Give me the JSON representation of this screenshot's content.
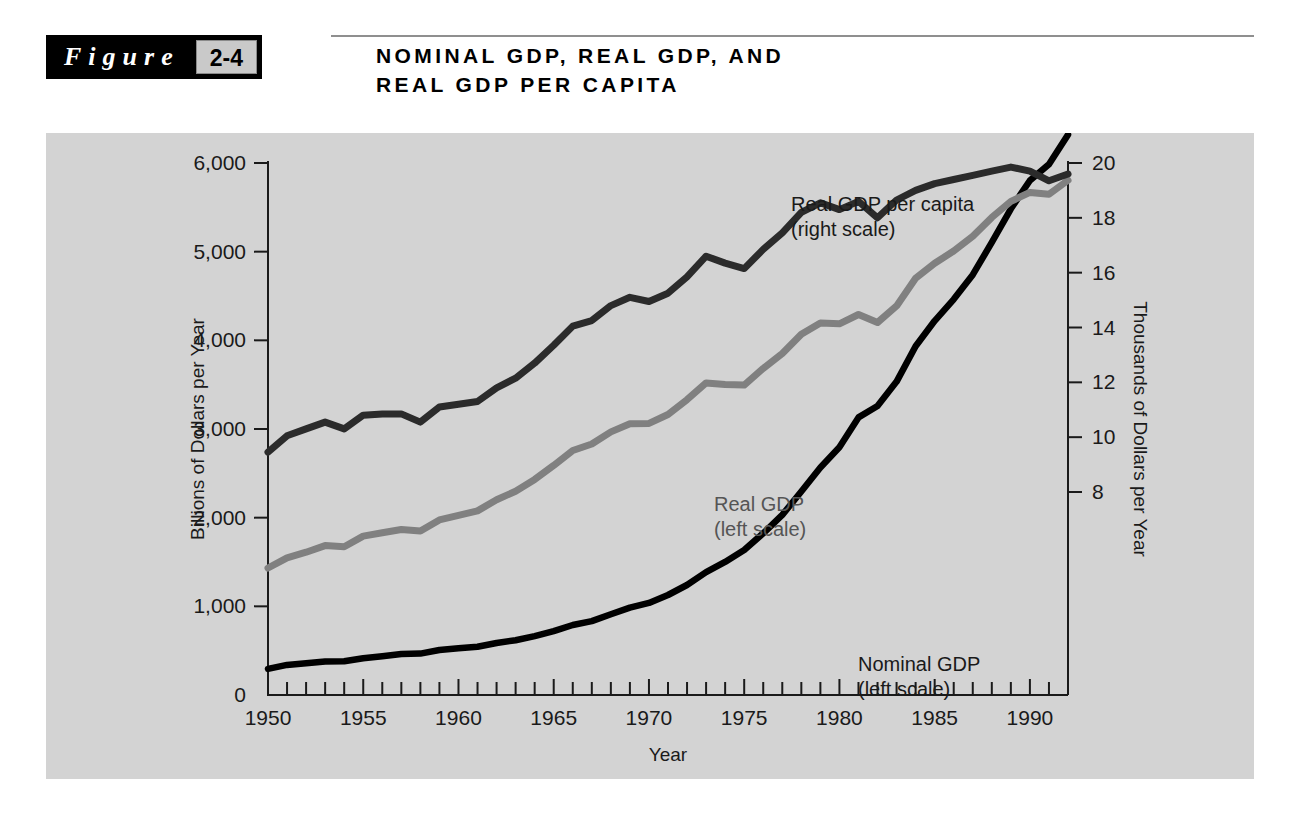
{
  "figure": {
    "word": "Figure",
    "number": "2-4",
    "title": "NOMINAL GDP, REAL GDP, AND\nREAL GDP PER CAPITA"
  },
  "colors": {
    "panel_background": "#d3d3d3",
    "nominal_gdp": "#000000",
    "real_gdp": "#808080",
    "real_gdp_per_capita": "#2b2b2b",
    "tag_background": "#000000",
    "number_box_background": "#c9c9c9"
  },
  "chart_data": {
    "type": "line",
    "title": "NOMINAL GDP, REAL GDP, AND REAL GDP PER CAPITA",
    "xlabel": "Year",
    "ylabel": "Billions of Dollars per Year",
    "y2label": "Thousands of Dollars per Year",
    "xlim": [
      1950,
      1992
    ],
    "ylim": [
      0,
      6000
    ],
    "y2lim": [
      6,
      20.8
    ],
    "grid": false,
    "legend": "inline-annotations",
    "x_ticks_labeled": [
      1950,
      1955,
      1960,
      1965,
      1970,
      1975,
      1980,
      1985,
      1990
    ],
    "x_tick_labels": [
      "1950",
      "1955",
      "1960",
      "1965",
      "1970",
      "1975",
      "1980",
      "1985",
      "1990"
    ],
    "x_minor_tick_step": 1,
    "y_ticks": [
      0,
      1000,
      2000,
      3000,
      4000,
      5000,
      6000
    ],
    "y_tick_labels": [
      "0",
      "1,000",
      "2,000",
      "3,000",
      "4,000",
      "5,000",
      "6,000"
    ],
    "y2_ticks": [
      8,
      10,
      12,
      14,
      16,
      18,
      20
    ],
    "y2_tick_labels": [
      "8",
      "10",
      "12",
      "14",
      "16",
      "18",
      "20"
    ],
    "x": [
      1950,
      1951,
      1952,
      1953,
      1954,
      1955,
      1956,
      1957,
      1958,
      1959,
      1960,
      1961,
      1962,
      1963,
      1964,
      1965,
      1966,
      1967,
      1968,
      1969,
      1970,
      1971,
      1972,
      1973,
      1974,
      1975,
      1976,
      1977,
      1978,
      1979,
      1980,
      1981,
      1982,
      1983,
      1984,
      1985,
      1986,
      1987,
      1988,
      1989,
      1990,
      1991,
      1992
    ],
    "series": [
      {
        "name": "Nominal GDP",
        "annotation": "Nominal GDP\n(left scale)",
        "axis": "left",
        "color": "#000000",
        "units": "Billions of Dollars per Year",
        "values": [
          294,
          339,
          358,
          379,
          380,
          415,
          438,
          461,
          467,
          507,
          527,
          545,
          586,
          618,
          664,
          720,
          789,
          834,
          911,
          985,
          1039,
          1128,
          1241,
          1386,
          1501,
          1635,
          1824,
          2031,
          2295,
          2566,
          2795,
          3131,
          3259,
          3535,
          3933,
          4220,
          4463,
          4740,
          5104,
          5484,
          5803,
          5986,
          6319
        ]
      },
      {
        "name": "Real GDP",
        "annotation": "Real GDP\n(left scale)",
        "axis": "left",
        "color": "#808080",
        "units": "Billions of Dollars per Year",
        "values": [
          1432,
          1547,
          1610,
          1685,
          1673,
          1792,
          1829,
          1867,
          1848,
          1975,
          2026,
          2076,
          2202,
          2299,
          2432,
          2589,
          2758,
          2831,
          2967,
          3060,
          3063,
          3163,
          3330,
          3520,
          3501,
          3495,
          3684,
          3852,
          4069,
          4197,
          4186,
          4291,
          4201,
          4388,
          4700,
          4869,
          5007,
          5174,
          5386,
          5567,
          5668,
          5648,
          5805
        ]
      },
      {
        "name": "Real GDP per capita",
        "annotation": "Real GDP per capita\n(right scale)",
        "axis": "right",
        "color": "#2b2b2b",
        "units": "Thousands of Dollars per Year",
        "values": [
          9.45,
          10.05,
          10.3,
          10.55,
          10.3,
          10.8,
          10.85,
          10.85,
          10.55,
          11.1,
          11.2,
          11.3,
          11.8,
          12.15,
          12.7,
          13.35,
          14.05,
          14.25,
          14.8,
          15.1,
          14.95,
          15.25,
          15.85,
          16.6,
          16.35,
          16.15,
          16.85,
          17.45,
          18.2,
          18.55,
          18.3,
          18.6,
          18.0,
          18.65,
          19.8,
          20.3,
          20.7,
          21.2,
          21.9,
          22.4,
          22.6,
          22.3,
          22.65
        ],
        "right_axis_values": [
          9.45,
          10.05,
          10.3,
          10.55,
          10.3,
          10.8,
          10.85,
          10.85,
          10.55,
          11.1,
          11.2,
          11.3,
          11.8,
          12.15,
          12.7,
          13.35,
          14.05,
          14.25,
          14.8,
          15.1,
          14.95,
          15.25,
          15.85,
          16.6,
          16.35,
          16.15,
          16.85,
          17.45,
          18.2,
          18.55,
          18.3,
          18.6,
          18.0,
          18.65,
          19.0,
          19.25,
          19.4,
          19.55,
          19.7,
          19.85,
          19.7,
          19.35,
          19.6
        ]
      }
    ],
    "annotations": [
      {
        "text": "Real GDP per capita",
        "text2": "(right scale)",
        "x": 1972,
        "y": 19.2
      },
      {
        "text": "Real GDP",
        "text2": "(left scale)",
        "x": 1966,
        "y": 3800
      },
      {
        "text": "Nominal GDP",
        "text2": "(left scale)",
        "x": 1974,
        "y": 2050
      }
    ]
  }
}
